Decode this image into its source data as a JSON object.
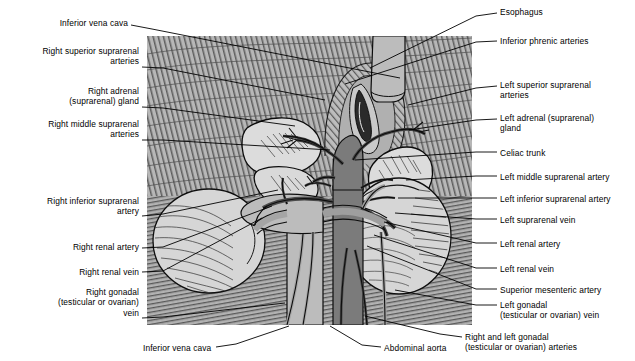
{
  "figure": {
    "panel": {
      "x": 147,
      "y": 36,
      "width": 325,
      "height": 289,
      "background_hex": "#b9b9b9"
    },
    "colors": {
      "background": "#ffffff",
      "text": "#000000",
      "leader_line": "#000000",
      "muscle_background": "#b9b9b9",
      "artery_dark": "#6e6e6e",
      "vein_light": "#b0b0b0",
      "organ_light": "#d8d8d8",
      "outline": "#000000"
    }
  },
  "labels_left": [
    {
      "id": "inferior-vena-cava-top",
      "lines": [
        "Inferior vena cava"
      ],
      "x": 128,
      "y": 18,
      "align": "right",
      "leader": [
        [
          131,
          25
        ],
        [
          152,
          29
        ],
        [
          400,
          78
        ]
      ]
    },
    {
      "id": "right-superior-suprarenal-arteries",
      "lines": [
        "Right superior suprarenal",
        "arteries"
      ],
      "x": 139,
      "y": 46,
      "align": "right",
      "leader": [
        [
          142,
          67
        ],
        [
          163,
          68
        ],
        [
          325,
          100
        ]
      ]
    },
    {
      "id": "right-adrenal-suprarenal-gland",
      "lines": [
        "Right adrenal",
        "(suprarenal) gland"
      ],
      "x": 139,
      "y": 86,
      "align": "right",
      "leader": [
        [
          142,
          107
        ],
        [
          163,
          108
        ],
        [
          295,
          126
        ]
      ]
    },
    {
      "id": "right-middle-suprarenal-arteries",
      "lines": [
        "Right middle suprarenal",
        "arteries"
      ],
      "x": 139,
      "y": 119,
      "align": "right",
      "leader": [
        [
          142,
          140
        ],
        [
          163,
          140
        ],
        [
          330,
          150
        ]
      ]
    },
    {
      "id": "right-inferior-suprarenal-artery",
      "lines": [
        "Right inferior suprarenal",
        "artery"
      ],
      "x": 139,
      "y": 196,
      "align": "right",
      "leader": [
        [
          142,
          216
        ],
        [
          163,
          214
        ],
        [
          278,
          190
        ]
      ]
    },
    {
      "id": "right-renal-artery",
      "lines": [
        "Right renal artery"
      ],
      "x": 139,
      "y": 242,
      "align": "right",
      "leader": [
        [
          142,
          248
        ],
        [
          163,
          247
        ],
        [
          272,
          206
        ]
      ]
    },
    {
      "id": "right-renal-vein",
      "lines": [
        "Right renal vein"
      ],
      "x": 139,
      "y": 267,
      "align": "right",
      "leader": [
        [
          142,
          272
        ],
        [
          163,
          271
        ],
        [
          262,
          218
        ]
      ]
    },
    {
      "id": "right-gonadal-testicular-or-ovarian-vein",
      "lines": [
        "Right gonadal",
        "(testicular or ovarian)",
        "vein"
      ],
      "x": 139,
      "y": 287,
      "align": "right",
      "leader": [
        [
          142,
          318
        ],
        [
          163,
          317
        ],
        [
          285,
          303
        ]
      ]
    }
  ],
  "labels_right": [
    {
      "id": "esophagus",
      "lines": [
        "Esophagus"
      ],
      "x": 500,
      "y": 7,
      "align": "left",
      "leader": [
        [
          497,
          13
        ],
        [
          476,
          16
        ],
        [
          370,
          68
        ]
      ]
    },
    {
      "id": "inferior-phrenic-arteries",
      "lines": [
        "Inferior phrenic arteries"
      ],
      "x": 500,
      "y": 36,
      "align": "left",
      "leader": [
        [
          497,
          41
        ],
        [
          476,
          42
        ],
        [
          345,
          84
        ]
      ]
    },
    {
      "id": "left-superior-suprarenal-arteries",
      "lines": [
        "Left superior suprarenal",
        "arteries"
      ],
      "x": 500,
      "y": 80,
      "align": "left",
      "leader": [
        [
          497,
          86
        ],
        [
          476,
          88
        ],
        [
          408,
          105
        ]
      ]
    },
    {
      "id": "left-adrenal-suprarenal-gland",
      "lines": [
        "Left adrenal (suprarenal)",
        "gland"
      ],
      "x": 500,
      "y": 113,
      "align": "left",
      "leader": [
        [
          497,
          119
        ],
        [
          476,
          120
        ],
        [
          409,
          130
        ]
      ]
    },
    {
      "id": "celiac-trunk",
      "lines": [
        "Celiac trunk"
      ],
      "x": 500,
      "y": 148,
      "align": "left",
      "leader": [
        [
          497,
          152
        ],
        [
          476,
          152
        ],
        [
          355,
          160
        ]
      ]
    },
    {
      "id": "left-middle-suprarenal-artery",
      "lines": [
        "Left middle suprarenal artery"
      ],
      "x": 500,
      "y": 172,
      "align": "left",
      "leader": [
        [
          497,
          176
        ],
        [
          476,
          176
        ],
        [
          406,
          180
        ]
      ]
    },
    {
      "id": "left-inferior-suprarenal-artery",
      "lines": [
        "Left inferior suprarenal artery"
      ],
      "x": 500,
      "y": 194,
      "align": "left",
      "leader": [
        [
          497,
          198
        ],
        [
          476,
          198
        ],
        [
          398,
          198
        ]
      ]
    },
    {
      "id": "left-suprarenal-vein",
      "lines": [
        "Left suprarenal vein"
      ],
      "x": 500,
      "y": 215,
      "align": "left",
      "leader": [
        [
          497,
          219
        ],
        [
          476,
          219
        ],
        [
          395,
          213
        ]
      ]
    },
    {
      "id": "left-renal-artery",
      "lines": [
        "Left renal artery"
      ],
      "x": 500,
      "y": 239,
      "align": "left",
      "leader": [
        [
          497,
          243
        ],
        [
          476,
          243
        ],
        [
          384,
          222
        ]
      ]
    },
    {
      "id": "left-renal-vein",
      "lines": [
        "Left renal vein"
      ],
      "x": 500,
      "y": 264,
      "align": "left",
      "leader": [
        [
          497,
          268
        ],
        [
          476,
          268
        ],
        [
          374,
          235
        ]
      ]
    },
    {
      "id": "superior-mesenteric-artery",
      "lines": [
        "Superior mesenteric artery"
      ],
      "x": 500,
      "y": 285,
      "align": "left",
      "leader": [
        [
          497,
          289
        ],
        [
          476,
          289
        ],
        [
          367,
          246
        ]
      ]
    },
    {
      "id": "left-gonadal-testicular-or-ovarian-vein",
      "lines": [
        "Left gonadal",
        "(testicular or ovarian) vein"
      ],
      "x": 500,
      "y": 300,
      "align": "left",
      "leader": [
        [
          497,
          305
        ],
        [
          476,
          305
        ],
        [
          395,
          290
        ]
      ]
    }
  ],
  "labels_bottom": [
    {
      "id": "inferior-vena-cava-bottom",
      "lines": [
        "Inferior vena cava"
      ],
      "x": 143,
      "y": 343,
      "align": "left",
      "leader": [
        [
          216,
          347
        ],
        [
          236,
          344
        ],
        [
          289,
          326
        ]
      ]
    },
    {
      "id": "abdominal-aorta",
      "lines": [
        "Abdominal aorta"
      ],
      "x": 384,
      "y": 343,
      "align": "left",
      "leader": [
        [
          381,
          347
        ],
        [
          362,
          345
        ],
        [
          330,
          326
        ]
      ]
    },
    {
      "id": "right-and-left-gonadal-testicular-or-ovarian-arteries",
      "lines": [
        "Right and left gonadal",
        "(testicular or ovarian) arteries"
      ],
      "x": 465,
      "y": 332,
      "align": "left",
      "leader": [
        [
          462,
          337
        ],
        [
          440,
          334
        ],
        [
          365,
          316
        ]
      ]
    }
  ]
}
